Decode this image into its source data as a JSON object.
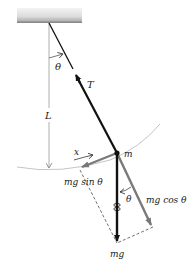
{
  "diagram": {
    "title": "",
    "type": "simple-pendulum-force-diagram",
    "labels": {
      "theta_top": "θ",
      "tension": "T",
      "length": "L",
      "displacement": "x",
      "mass": "m",
      "tangential": "mg sin θ",
      "radial": "mg cos θ",
      "theta_bottom": "θ",
      "weight": "mg"
    },
    "colors": {
      "background": "#ffffff",
      "ceiling_light": "#e6e6e6",
      "ceiling_dark": "#8a8a8a",
      "string": "#111111",
      "force_gray": "#7a7a7a",
      "weight_arrow": "#111111",
      "reference_line": "#9a9a9a",
      "dashed": "#333333",
      "arc": "#b0b0b0"
    },
    "elements": [
      {
        "id": "ceiling",
        "kind": "support"
      },
      {
        "id": "string",
        "kind": "line",
        "from": "pivot",
        "to": "mass"
      },
      {
        "id": "tension-arrow",
        "kind": "vector",
        "label": "T"
      },
      {
        "id": "vertical-reference",
        "kind": "line",
        "label": "L"
      },
      {
        "id": "swing-arc",
        "kind": "arc"
      },
      {
        "id": "weight-vector",
        "kind": "vector",
        "label": "mg"
      },
      {
        "id": "radial-component",
        "kind": "vector",
        "label": "mg cos θ"
      },
      {
        "id": "tangential-component",
        "kind": "vector",
        "label": "mg sin θ"
      }
    ]
  }
}
